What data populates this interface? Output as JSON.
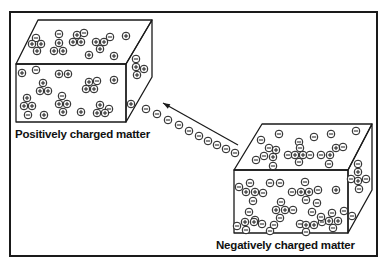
{
  "diagram": {
    "labels": {
      "positive": "Positively charged matter",
      "negative": "Negatively charged matter"
    },
    "colors": {
      "ink": "#1a1a1a",
      "background": "#ffffff"
    },
    "frame": {
      "x": 10,
      "y": 12,
      "w": 367,
      "h": 244
    },
    "boxes": [
      {
        "name": "positive-box",
        "front": [
          [
            16,
            64
          ],
          [
            126,
            64
          ],
          [
            126,
            122
          ],
          [
            16,
            122
          ]
        ],
        "top": [
          [
            16,
            64
          ],
          [
            38,
            20
          ],
          [
            152,
            20
          ],
          [
            126,
            64
          ]
        ],
        "side": [
          [
            126,
            64
          ],
          [
            152,
            20
          ],
          [
            152,
            77
          ],
          [
            126,
            122
          ]
        ],
        "label_pos": [
          15,
          138
        ],
        "label_key": "positive",
        "particles": [
          [
            "-",
            36,
            38
          ],
          [
            "+",
            32,
            44
          ],
          [
            "+",
            41,
            44
          ],
          [
            "+",
            37,
            51
          ],
          [
            "-",
            59,
            34
          ],
          [
            "+",
            59,
            43
          ],
          [
            "+",
            54,
            51
          ],
          [
            "+",
            63,
            51
          ],
          [
            "+",
            77,
            35
          ],
          [
            "-",
            84,
            33
          ],
          [
            "+",
            73,
            42
          ],
          [
            "+",
            81,
            42
          ],
          [
            "+",
            96,
            42
          ],
          [
            "+",
            104,
            42
          ],
          [
            "-",
            110,
            37
          ],
          [
            "+",
            100,
            49
          ],
          [
            "+",
            126,
            36
          ],
          [
            "+",
            89,
            55
          ],
          [
            "+",
            114,
            56
          ],
          [
            "+",
            22,
            73
          ],
          [
            "-",
            36,
            70
          ],
          [
            "+",
            59,
            74
          ],
          [
            "+",
            68,
            74
          ],
          [
            "+",
            43,
            83
          ],
          [
            "+",
            40,
            91
          ],
          [
            "+",
            48,
            91
          ],
          [
            "+",
            89,
            82
          ],
          [
            "-",
            97,
            81
          ],
          [
            "+",
            86,
            89
          ],
          [
            "+",
            94,
            89
          ],
          [
            "+",
            114,
            80
          ],
          [
            "+",
            27,
            98
          ],
          [
            "+",
            24,
            106
          ],
          [
            "+",
            32,
            106
          ],
          [
            "-",
            28,
            115
          ],
          [
            "-",
            62,
            96
          ],
          [
            "+",
            59,
            104
          ],
          [
            "+",
            67,
            104
          ],
          [
            "+",
            63,
            112
          ],
          [
            "+",
            44,
            115
          ],
          [
            "+",
            81,
            112
          ],
          [
            "+",
            100,
            105
          ],
          [
            "-",
            109,
            109
          ],
          [
            "+",
            97,
            113
          ],
          [
            "+",
            105,
            113
          ],
          [
            "-",
            136,
            59
          ],
          [
            "+",
            136,
            67
          ],
          [
            "+",
            144,
            69
          ],
          [
            "+",
            137,
            75
          ],
          [
            "+",
            131,
            104
          ]
        ]
      },
      {
        "name": "negative-box",
        "front": [
          [
            234,
            170
          ],
          [
            348,
            170
          ],
          [
            348,
            233
          ],
          [
            234,
            233
          ]
        ],
        "top": [
          [
            234,
            170
          ],
          [
            262,
            124
          ],
          [
            372,
            124
          ],
          [
            348,
            170
          ]
        ],
        "side": [
          [
            348,
            170
          ],
          [
            372,
            124
          ],
          [
            372,
            190
          ],
          [
            348,
            233
          ]
        ],
        "label_pos": [
          216,
          249
        ],
        "label_key": "negative",
        "particles": [
          [
            "-",
            261,
            140
          ],
          [
            "-",
            279,
            134
          ],
          [
            "-",
            299,
            142
          ],
          [
            "-",
            314,
            137
          ],
          [
            "-",
            331,
            134
          ],
          [
            "-",
            356,
            131
          ],
          [
            "-",
            269,
            148
          ],
          [
            "-",
            256,
            160
          ],
          [
            "-",
            264,
            156
          ],
          [
            "+",
            273,
            157
          ],
          [
            "+",
            276,
            150
          ],
          [
            "-",
            273,
            166
          ],
          [
            "-",
            288,
            155
          ],
          [
            "+",
            295,
            155
          ],
          [
            "+",
            303,
            155
          ],
          [
            "-",
            310,
            155
          ],
          [
            "-",
            299,
            162
          ],
          [
            "-",
            321,
            155
          ],
          [
            "+",
            330,
            155
          ],
          [
            "-",
            329,
            164
          ],
          [
            "+",
            336,
            148
          ],
          [
            "-",
            343,
            147
          ],
          [
            "-",
            300,
            148
          ],
          [
            "-",
            239,
            187
          ],
          [
            "-",
            250,
            183
          ],
          [
            "+",
            246,
            192
          ],
          [
            "+",
            255,
            192
          ],
          [
            "-",
            263,
            193
          ],
          [
            "-",
            253,
            201
          ],
          [
            "-",
            270,
            183
          ],
          [
            "-",
            280,
            183
          ],
          [
            "-",
            305,
            182
          ],
          [
            "-",
            292,
            192
          ],
          [
            "+",
            301,
            192
          ],
          [
            "+",
            309,
            192
          ],
          [
            "-",
            318,
            190
          ],
          [
            "-",
            306,
            200
          ],
          [
            "+",
            336,
            190
          ],
          [
            "-",
            281,
            202
          ],
          [
            "+",
            276,
            210
          ],
          [
            "+",
            285,
            210
          ],
          [
            "-",
            293,
            210
          ],
          [
            "-",
            280,
            218
          ],
          [
            "-",
            317,
            203
          ],
          [
            "-",
            249,
            212
          ],
          [
            "-",
            255,
            220
          ],
          [
            "+",
            245,
            222
          ],
          [
            "+",
            254,
            222
          ],
          [
            "-",
            237,
            226
          ],
          [
            "-",
            262,
            224
          ],
          [
            "-",
            246,
            230
          ],
          [
            "-",
            270,
            231
          ],
          [
            "-",
            274,
            225
          ],
          [
            "-",
            300,
            224
          ],
          [
            "+",
            306,
            225
          ],
          [
            "+",
            314,
            225
          ],
          [
            "-",
            322,
            222
          ],
          [
            "-",
            306,
            232
          ],
          [
            "-",
            312,
            212
          ],
          [
            "-",
            321,
            217
          ],
          [
            "-",
            332,
            213
          ],
          [
            "+",
            329,
            221
          ],
          [
            "+",
            338,
            221
          ],
          [
            "-",
            344,
            211
          ],
          [
            "-",
            333,
            228
          ],
          [
            "-",
            358,
            164
          ],
          [
            "+",
            358,
            172
          ],
          [
            "-",
            351,
            179
          ],
          [
            "+",
            358,
            181
          ],
          [
            "-",
            366,
            179
          ],
          [
            "-",
            359,
            189
          ],
          [
            "-",
            352,
            216
          ]
        ]
      }
    ],
    "electron_stream": {
      "particles": [
        [
          "-",
          146,
          109
        ],
        [
          "-",
          157,
          114
        ],
        [
          "-",
          168,
          120
        ],
        [
          "-",
          179,
          125
        ],
        [
          "-",
          189,
          131
        ],
        [
          "-",
          199,
          136
        ],
        [
          "-",
          208,
          141
        ],
        [
          "-",
          217,
          145
        ],
        [
          "-",
          226,
          149
        ],
        [
          "-",
          235,
          153
        ]
      ]
    },
    "arrow": {
      "from": [
        238,
        145
      ],
      "to": [
        163,
        103
      ],
      "direction": "toward positive matter"
    }
  }
}
